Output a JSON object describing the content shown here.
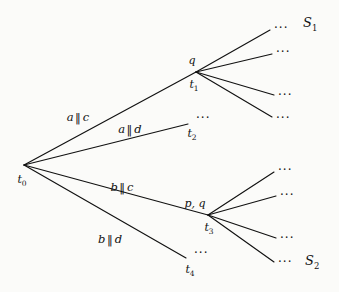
{
  "figure": {
    "name": "computation-tree",
    "background_color": "#fbfbf9",
    "ink_color": "#111111",
    "width": 339,
    "height": 292
  },
  "nodes": [
    {
      "id": "t0",
      "label": "t",
      "sub": "0",
      "x": 24,
      "y": 165,
      "label_x": 22,
      "label_y": 181
    },
    {
      "id": "t1",
      "label": "t",
      "sub": "1",
      "x": 196,
      "y": 72,
      "label_x": 194,
      "label_y": 86
    },
    {
      "id": "t2",
      "label": "t",
      "sub": "2",
      "x": 188,
      "y": 124,
      "label_x": 192,
      "label_y": 135
    },
    {
      "id": "t3",
      "label": "t",
      "sub": "3",
      "x": 208,
      "y": 215,
      "label_x": 209,
      "label_y": 229
    },
    {
      "id": "t4",
      "label": "t",
      "sub": "4",
      "x": 186,
      "y": 258,
      "label_x": 190,
      "label_y": 271
    }
  ],
  "node_annotations": [
    {
      "id": "q-at-t1",
      "text": "q",
      "x": 192,
      "y": 60
    },
    {
      "id": "pq-at-t3",
      "text": "p, q",
      "x": 195,
      "y": 203
    }
  ],
  "edge_labels": [
    {
      "id": "a-par-c",
      "left": "a",
      "symbol": "‖",
      "right": "c",
      "x": 78,
      "y": 118
    },
    {
      "id": "a-par-d",
      "left": "a",
      "symbol": "‖",
      "right": "d",
      "x": 130,
      "y": 130
    },
    {
      "id": "b-par-c",
      "left": "b",
      "symbol": "‖",
      "right": "c",
      "x": 122,
      "y": 188
    },
    {
      "id": "b-par-d",
      "left": "b",
      "symbol": "‖",
      "right": "d",
      "x": 110,
      "y": 240
    }
  ],
  "edges": [
    {
      "id": "t0-t1",
      "x1": 24,
      "y1": 165,
      "x2": 196,
      "y2": 72
    },
    {
      "id": "t0-t2",
      "x1": 24,
      "y1": 165,
      "x2": 188,
      "y2": 124
    },
    {
      "id": "t0-t3",
      "x1": 24,
      "y1": 165,
      "x2": 208,
      "y2": 215
    },
    {
      "id": "t0-t4",
      "x1": 24,
      "y1": 165,
      "x2": 186,
      "y2": 258
    },
    {
      "id": "t1-b1",
      "x1": 196,
      "y1": 72,
      "x2": 270,
      "y2": 30
    },
    {
      "id": "t1-b2",
      "x1": 196,
      "y1": 72,
      "x2": 272,
      "y2": 54
    },
    {
      "id": "t1-b3",
      "x1": 196,
      "y1": 72,
      "x2": 274,
      "y2": 95
    },
    {
      "id": "t1-b4",
      "x1": 196,
      "y1": 72,
      "x2": 272,
      "y2": 117
    },
    {
      "id": "t3-b1",
      "x1": 208,
      "y1": 215,
      "x2": 274,
      "y2": 172
    },
    {
      "id": "t3-b2",
      "x1": 208,
      "y1": 215,
      "x2": 276,
      "y2": 196
    },
    {
      "id": "t3-b3",
      "x1": 208,
      "y1": 215,
      "x2": 276,
      "y2": 238
    },
    {
      "id": "t3-b4",
      "x1": 208,
      "y1": 215,
      "x2": 274,
      "y2": 262
    }
  ],
  "ellipses": [
    {
      "id": "ell-t2",
      "text": "···",
      "x": 196,
      "y": 118
    },
    {
      "id": "ell-t4",
      "text": "···",
      "x": 194,
      "y": 253
    },
    {
      "id": "ell-t1-b1",
      "text": "···",
      "x": 274,
      "y": 28
    },
    {
      "id": "ell-t1-b2",
      "text": "···",
      "x": 276,
      "y": 52
    },
    {
      "id": "ell-t1-b3",
      "text": "···",
      "x": 278,
      "y": 95
    },
    {
      "id": "ell-t1-b4",
      "text": "···",
      "x": 276,
      "y": 118
    },
    {
      "id": "ell-t3-b1",
      "text": "···",
      "x": 278,
      "y": 170
    },
    {
      "id": "ell-t3-b2",
      "text": "···",
      "x": 280,
      "y": 195
    },
    {
      "id": "ell-t3-b3",
      "text": "···",
      "x": 280,
      "y": 238
    },
    {
      "id": "ell-t3-b4",
      "text": "···",
      "x": 278,
      "y": 262
    }
  ],
  "set_labels": [
    {
      "id": "S1",
      "label": "S",
      "sub": "1",
      "x": 303,
      "y": 24
    },
    {
      "id": "S2",
      "label": "S",
      "sub": "2",
      "x": 305,
      "y": 262
    }
  ]
}
